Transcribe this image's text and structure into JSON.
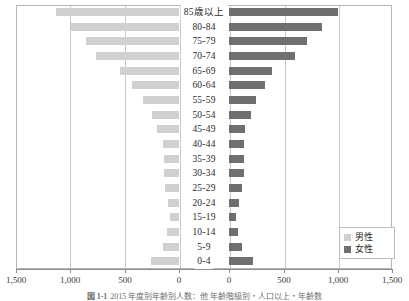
{
  "chart_data": {
    "type": "bar",
    "subtype": "population-pyramid",
    "title": "",
    "xlabel": "",
    "ylabel": "",
    "orientation": "horizontal",
    "grid": true,
    "legend_position": "bottom-right",
    "categories": [
      "85歳以上",
      "80-84",
      "75-79",
      "70-74",
      "65-69",
      "60-64",
      "55-59",
      "50-54",
      "45-49",
      "40-44",
      "35-39",
      "30-34",
      "25-29",
      "20-24",
      "15-19",
      "10-14",
      "5-9",
      "0-4"
    ],
    "series": [
      {
        "name": "男性",
        "color": "#d0d0d0",
        "direction": "left",
        "values": [
          1130,
          990,
          860,
          760,
          540,
          430,
          330,
          250,
          200,
          150,
          140,
          140,
          130,
          100,
          80,
          110,
          150,
          260
        ]
      },
      {
        "name": "女性",
        "color": "#6f6f6f",
        "direction": "right",
        "values": [
          1000,
          860,
          720,
          610,
          400,
          330,
          250,
          200,
          150,
          140,
          140,
          140,
          120,
          90,
          60,
          80,
          120,
          220
        ]
      }
    ],
    "left_axis": {
      "label": "男性",
      "ticks": [
        1500,
        1000,
        500,
        0
      ],
      "max": 1500
    },
    "right_axis": {
      "label": "女性",
      "ticks": [
        0,
        500,
        1000,
        1500
      ],
      "max": 1500
    },
    "tick_labels_left": [
      "1,500",
      "1,000",
      "500",
      "0"
    ],
    "tick_labels_right": [
      "0",
      "500",
      "1,000",
      "1,500"
    ]
  },
  "legend": {
    "items": [
      {
        "label": "男性",
        "color": "#d0d0d0"
      },
      {
        "label": "女性",
        "color": "#6f6f6f"
      }
    ]
  },
  "caption": {
    "number": "図 1-1",
    "text": "2015 年度別年齢別人数：他 年齢階級別・人口以上・年齢数"
  },
  "colors": {
    "male": "#d0d0d0",
    "female": "#6f6f6f",
    "grid": "#c9c9c9",
    "frame": "#b6b6b6",
    "axis": "#8c8c8c"
  }
}
